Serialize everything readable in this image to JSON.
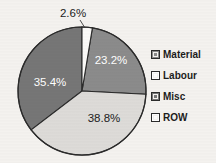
{
  "chart_data": {
    "type": "pie",
    "title": "",
    "subtitle": "",
    "xlabel": "",
    "ylabel": "",
    "categories": [
      "Material",
      "Labour",
      "Misc",
      "ROW"
    ],
    "values": [
      23.2,
      38.8,
      35.4,
      2.6
    ],
    "value_unit": "%",
    "data_labels": [
      "23.2%",
      "38.8%",
      "35.4%",
      "2.6%"
    ],
    "slice_colors": [
      "#8b8b8b",
      "#dddbd8",
      "#767676",
      "#fbfaf8"
    ],
    "label_text_colors": [
      "#ffffff",
      "#1c1c1c",
      "#ffffff",
      "#1c1c1c"
    ],
    "start_angle_deg": 0,
    "direction": "clockwise",
    "legend_position": "right",
    "grid": false,
    "outline_color": "#2b2b2b",
    "background_color": "#f4f2ef",
    "slices": [
      {
        "name": "Material",
        "value": 23.2,
        "label": "23.2%",
        "color": "#8b8b8b",
        "label_color": "#ffffff",
        "label_placement": "inside"
      },
      {
        "name": "Labour",
        "value": 38.8,
        "label": "38.8%",
        "color": "#dddbd8",
        "label_color": "#1c1c1c",
        "label_placement": "inside"
      },
      {
        "name": "Misc",
        "value": 35.4,
        "label": "35.4%",
        "color": "#767676",
        "label_color": "#ffffff",
        "label_placement": "inside"
      },
      {
        "name": "ROW",
        "value": 2.6,
        "label": "2.6%",
        "color": "#fbfaf8",
        "label_color": "#1c1c1c",
        "label_placement": "outside-top"
      }
    ]
  },
  "legend": {
    "items": [
      {
        "label": "Material",
        "swatch_color": "#8b8b8b"
      },
      {
        "label": "Labour",
        "swatch_color": "#ffffff"
      },
      {
        "label": "Misc",
        "swatch_color": "#767676"
      },
      {
        "label": "ROW",
        "swatch_color": "#ffffff"
      }
    ]
  }
}
